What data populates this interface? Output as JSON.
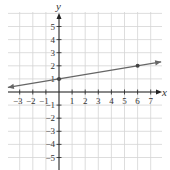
{
  "chart_data": {
    "type": "line",
    "title": "",
    "xlabel": "x",
    "ylabel": "y",
    "xlim": [
      -4,
      8
    ],
    "ylim": [
      -6,
      6
    ],
    "grid": true,
    "x_ticks": [
      -3,
      -2,
      -1,
      1,
      2,
      3,
      4,
      5,
      6,
      7
    ],
    "y_ticks": [
      -5,
      -4,
      -3,
      -2,
      -1,
      1,
      2,
      3,
      4,
      5
    ],
    "series": [
      {
        "name": "line",
        "equation": "y = (1/6)x + 1",
        "slope": 0.1667,
        "intercept": 1,
        "x_start": -3.9,
        "x_end": 7.8,
        "marked_points": [
          [
            0,
            1
          ],
          [
            6,
            2
          ]
        ],
        "arrows_both_ends": true,
        "color": "#666666"
      }
    ]
  },
  "labels": {
    "x_axis": "x",
    "y_axis": "y"
  }
}
